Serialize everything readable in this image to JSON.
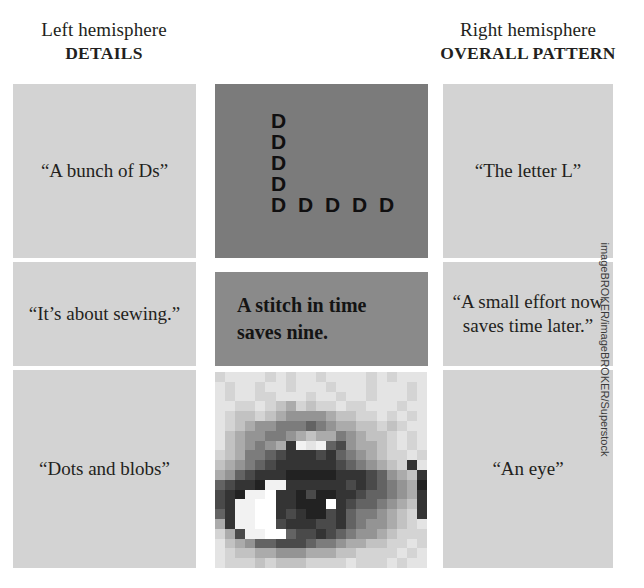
{
  "figure": {
    "background": "#ffffff",
    "panel_color": "#d3d3d3",
    "middle_dark_color": "#7b7b7b",
    "middle_mid_color": "#8a8a8a",
    "text_color": "#231f20"
  },
  "headers": {
    "left": {
      "sub": "Left hemisphere",
      "main": "DETAILS"
    },
    "right": {
      "sub": "Right hemisphere",
      "main": "OVERALL PATTERN"
    }
  },
  "rows": [
    {
      "id": "letters",
      "left_caption": "“A bunch of Ds”",
      "right_caption": "“The letter L”",
      "stimulus_type": "letter-mosaic",
      "stimulus_lines": [
        "D",
        "D",
        "D",
        "D",
        "D D D D D"
      ]
    },
    {
      "id": "proverb",
      "left_caption": "“It’s about sewing.”",
      "right_caption": "“A small effort now saves time later.”",
      "stimulus_type": "text",
      "stimulus_lines": [
        "A stitch in time",
        "saves nine."
      ]
    },
    {
      "id": "eye",
      "left_caption": "“Dots and blobs”",
      "right_caption": "“An eye”",
      "stimulus_type": "pixelated-photo",
      "stimulus_alt": "pixelated photograph of a human eye"
    }
  ],
  "credit": "imageBROKER/imageBROKER/Superstock",
  "eye_mosaic": {
    "cols": 21,
    "rows": 20,
    "palette": {
      "0": "#ffffff",
      "1": "#f2f2f2",
      "2": "#e4e4e4",
      "3": "#d4d4d4",
      "4": "#c2c2c2",
      "5": "#ababab",
      "6": "#949494",
      "7": "#7c7c7c",
      "8": "#636363",
      "9": "#4a4a4a",
      "a": "#343434",
      "b": "#222222"
    },
    "grid": [
      "322223232232222323222",
      "2322322322232223222322",
      "232233222322322322232",
      "223323453433233222322",
      "234434566665443323232",
      "234566777876554434322",
      "245667765455765443232",
      "2456765a1218965543232",
      "3457789aaa9a8765433232",
      "456789aaaaaa9876543a2",
      "5689aaabbbbbaaa98654a3",
      "89aab11aaaaaa9a98765b3",
      "9ab110aab9bbaa988765a3",
      "9a1100aabbb0a9887654a2",
      "8a1100a9abb9a8776543a3",
      "5a11009aaa99a87665432",
      "3591100899a98766543332",
      "2456889998776554433232",
      "234455666555443333232",
      "233343444333323332322"
    ]
  }
}
